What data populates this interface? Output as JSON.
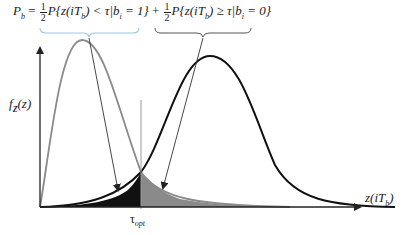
{
  "equation": {
    "lhs": "P",
    "lhs_sub": "b",
    "equals": "=",
    "term1": {
      "coef_num": "1",
      "coef_den": "2",
      "expr": "P{z(iT",
      "expr_sub": "b",
      "expr_rest": ") < τ|b",
      "cond_sub": "i",
      "cond_rest": " = 1}"
    },
    "plus": "+",
    "term2": {
      "coef_num": "1",
      "coef_den": "2",
      "expr": "P{z(iT",
      "expr_sub": "b",
      "expr_rest": ") ≥ τ|b",
      "cond_sub": "i",
      "cond_rest": " = 0}"
    }
  },
  "axes": {
    "ylabel": "f",
    "ylabel_sub": "Z",
    "ylabel_rest": "(z)",
    "xlabel": "z(iT",
    "xlabel_sub": "b",
    "xlabel_rest": ")"
  },
  "threshold": {
    "label": "τ",
    "label_sub": "opt"
  },
  "colors": {
    "left_curve": "#808080",
    "right_curve": "#111111",
    "shade_dark": "#111111",
    "shade_gray": "#8a8a8a",
    "brace_left": "#9fc9d9",
    "brace_right": "#444444"
  }
}
